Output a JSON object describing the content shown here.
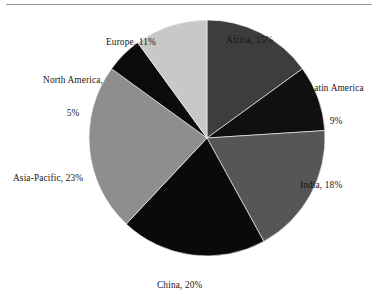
{
  "figure": {
    "background_color": "#ffffff",
    "rule_color": "#9a9a9a",
    "slice_border_color": "#ffffff"
  },
  "chart_data": {
    "type": "pie",
    "title": "",
    "subtitle": "",
    "xlabel": "",
    "ylabel": "",
    "legend_position": "none",
    "label_format": "name, percent",
    "start_angle_deg": 0,
    "direction": "clockwise",
    "center": {
      "x": 207,
      "y": 138
    },
    "radius": 118,
    "categories": [
      "Africa",
      "Latin America",
      "India",
      "China",
      "Asia-Pacific",
      "North America",
      "Europe"
    ],
    "values": [
      15,
      9,
      18,
      20,
      23,
      5,
      11
    ],
    "units": "%",
    "total": 101,
    "slices": [
      {
        "name": "Africa",
        "value": 15,
        "percent_text": "15%",
        "label": "Africa, 15%",
        "label_lines": [
          "Africa, 15%"
        ],
        "color": "#3d3d3d",
        "start_deg": 0,
        "end_deg": 54
      },
      {
        "name": "Latin America",
        "value": 9,
        "percent_text": "9%",
        "label": "Latin America 9%",
        "label_lines": [
          "Latin America",
          "9%"
        ],
        "color": "#101010",
        "start_deg": 54,
        "end_deg": 86.4
      },
      {
        "name": "India",
        "value": 18,
        "percent_text": "18%",
        "label": "India, 18%",
        "label_lines": [
          "India, 18%"
        ],
        "color": "#565656",
        "start_deg": 86.4,
        "end_deg": 151.2
      },
      {
        "name": "China",
        "value": 20,
        "percent_text": "20%",
        "label": "China, 20%",
        "label_lines": [
          "China, 20%"
        ],
        "color": "#0a0a0a",
        "start_deg": 151.2,
        "end_deg": 223.2
      },
      {
        "name": "Asia-Pacific",
        "value": 23,
        "percent_text": "23%",
        "label": "Asia-Pacific, 23%",
        "label_lines": [
          "Asia-Pacific, 23%"
        ],
        "color": "#8e8e8e",
        "start_deg": 223.2,
        "end_deg": 306
      },
      {
        "name": "North America",
        "value": 5,
        "percent_text": "5%",
        "label": "North America, 5%",
        "label_lines": [
          "North America,",
          "5%"
        ],
        "color": "#0b0b0b",
        "start_deg": 306,
        "end_deg": 324
      },
      {
        "name": "Europe",
        "value": 11,
        "percent_text": "11%",
        "label": "Europe, 11%",
        "label_lines": [
          "Europe, 11%"
        ],
        "color": "#c8c8c8",
        "start_deg": 324,
        "end_deg": 360
      }
    ]
  }
}
